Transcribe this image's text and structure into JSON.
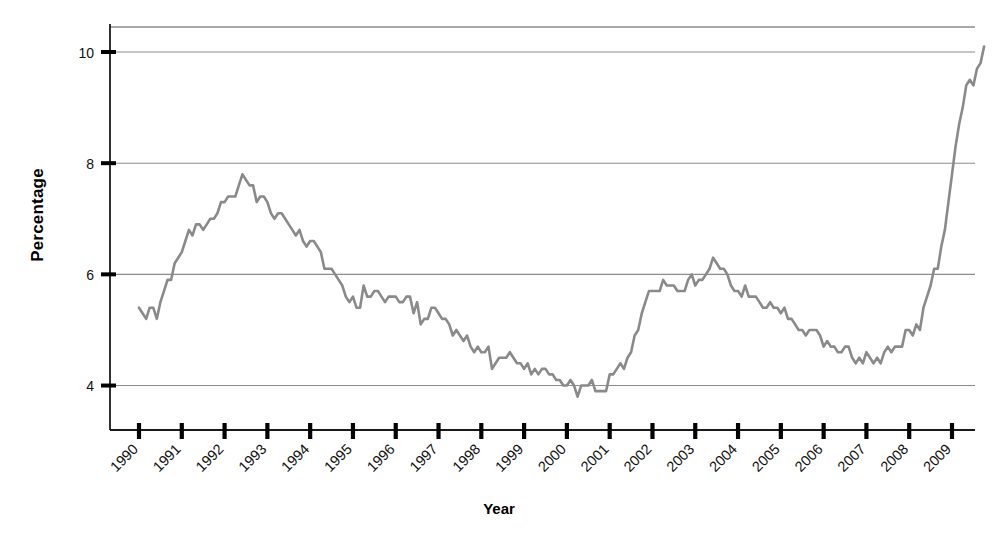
{
  "chart_data": {
    "type": "line",
    "title": "",
    "xlabel": "Year",
    "ylabel": "Percentage",
    "xlim": [
      1990,
      2009.92
    ],
    "ylim": [
      3.2,
      10.45
    ],
    "grid": true,
    "grid_axis": "y",
    "legend": "none",
    "line_color": "#8a8a8a",
    "axis_color": "#1a1a1a",
    "grid_color": "#8c8c8c",
    "y_ticks": [
      4,
      6,
      8,
      10
    ],
    "y_tick_labels": [
      "4",
      "6",
      "8",
      "10"
    ],
    "x_ticks": [
      1990,
      1991,
      1992,
      1993,
      1994,
      1995,
      1996,
      1997,
      1998,
      1999,
      2000,
      2001,
      2002,
      2003,
      2004,
      2005,
      2006,
      2007,
      2008,
      2009
    ],
    "x_tick_labels": [
      "1990",
      "1991",
      "1992",
      "1993",
      "1994",
      "1995",
      "1996",
      "1997",
      "1998",
      "1999",
      "2000",
      "2001",
      "2002",
      "2003",
      "2004",
      "2005",
      "2006",
      "2007",
      "2008",
      "2009"
    ],
    "x_tick_rotation": -45,
    "series": [
      {
        "name": "Unemployment rate",
        "x_start": 1990.0,
        "x_step": 0.0833333,
        "values": [
          5.4,
          5.3,
          5.2,
          5.4,
          5.4,
          5.2,
          5.5,
          5.7,
          5.9,
          5.9,
          6.2,
          6.3,
          6.4,
          6.6,
          6.8,
          6.7,
          6.9,
          6.9,
          6.8,
          6.9,
          7.0,
          7.0,
          7.1,
          7.3,
          7.3,
          7.4,
          7.4,
          7.4,
          7.6,
          7.8,
          7.7,
          7.6,
          7.6,
          7.3,
          7.4,
          7.4,
          7.3,
          7.1,
          7.0,
          7.1,
          7.1,
          7.0,
          6.9,
          6.8,
          6.7,
          6.8,
          6.6,
          6.5,
          6.6,
          6.6,
          6.5,
          6.4,
          6.1,
          6.1,
          6.1,
          6.0,
          5.9,
          5.8,
          5.6,
          5.5,
          5.6,
          5.4,
          5.4,
          5.8,
          5.6,
          5.6,
          5.7,
          5.7,
          5.6,
          5.5,
          5.6,
          5.6,
          5.6,
          5.5,
          5.5,
          5.6,
          5.6,
          5.3,
          5.5,
          5.1,
          5.2,
          5.2,
          5.4,
          5.4,
          5.3,
          5.2,
          5.2,
          5.1,
          4.9,
          5.0,
          4.9,
          4.8,
          4.9,
          4.7,
          4.6,
          4.7,
          4.6,
          4.6,
          4.7,
          4.3,
          4.4,
          4.5,
          4.5,
          4.5,
          4.6,
          4.5,
          4.4,
          4.4,
          4.3,
          4.4,
          4.2,
          4.3,
          4.2,
          4.3,
          4.3,
          4.2,
          4.2,
          4.1,
          4.1,
          4.0,
          4.0,
          4.1,
          4.0,
          3.8,
          4.0,
          4.0,
          4.0,
          4.1,
          3.9,
          3.9,
          3.9,
          3.9,
          4.2,
          4.2,
          4.3,
          4.4,
          4.3,
          4.5,
          4.6,
          4.9,
          5.0,
          5.3,
          5.5,
          5.7,
          5.7,
          5.7,
          5.7,
          5.9,
          5.8,
          5.8,
          5.8,
          5.7,
          5.7,
          5.7,
          5.9,
          6.0,
          5.8,
          5.9,
          5.9,
          6.0,
          6.1,
          6.3,
          6.2,
          6.1,
          6.1,
          6.0,
          5.8,
          5.7,
          5.7,
          5.6,
          5.8,
          5.6,
          5.6,
          5.6,
          5.5,
          5.4,
          5.4,
          5.5,
          5.4,
          5.4,
          5.3,
          5.4,
          5.2,
          5.2,
          5.1,
          5.0,
          5.0,
          4.9,
          5.0,
          5.0,
          5.0,
          4.9,
          4.7,
          4.8,
          4.7,
          4.7,
          4.6,
          4.6,
          4.7,
          4.7,
          4.5,
          4.4,
          4.5,
          4.4,
          4.6,
          4.5,
          4.4,
          4.5,
          4.4,
          4.6,
          4.7,
          4.6,
          4.7,
          4.7,
          4.7,
          5.0,
          5.0,
          4.9,
          5.1,
          5.0,
          5.4,
          5.6,
          5.8,
          6.1,
          6.1,
          6.5,
          6.8,
          7.3,
          7.8,
          8.3,
          8.7,
          9.0,
          9.4,
          9.5,
          9.4,
          9.7,
          9.8,
          10.1
        ]
      }
    ]
  },
  "axes": {
    "y_axis_title": "Percentage",
    "x_axis_title": "Year"
  }
}
